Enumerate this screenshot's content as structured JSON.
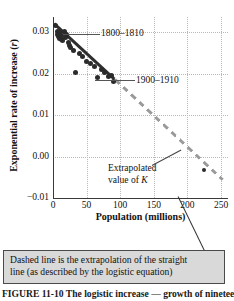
{
  "chart_data": {
    "type": "scatter",
    "title": "",
    "xlabel": "Population (millions)",
    "ylabel": "Exponential rate of increase (r)",
    "xlim": [
      0,
      260
    ],
    "ylim": [
      -0.012,
      0.034
    ],
    "xticks": [
      0,
      50,
      100,
      150,
      200,
      250
    ],
    "xtick_labels": [
      "0",
      "50",
      "100",
      "150",
      "200",
      "250"
    ],
    "yticks": [
      0.03,
      0.02,
      0.01,
      0.0,
      -0.01
    ],
    "ytick_labels": [
      "0.03",
      "0.02",
      "0.01",
      "0.00",
      "−0.01"
    ],
    "grid": true,
    "grid_style": "dotted",
    "legend": "none",
    "series": [
      {
        "name": "Observed decadal growth rates",
        "type": "scatter",
        "marker": "filled-circle",
        "color": "#2b2b2b",
        "x": [
          4,
          6,
          7,
          8,
          9,
          10,
          11,
          12,
          13,
          14,
          17,
          19,
          20,
          23,
          24,
          26,
          31,
          33,
          39,
          44,
          50,
          55,
          62,
          66,
          72,
          76,
          83,
          87,
          90
        ],
        "y": [
          0.0318,
          0.0303,
          0.0295,
          0.029,
          0.0286,
          0.03,
          0.0288,
          0.0284,
          0.0292,
          0.028,
          0.0302,
          0.0288,
          0.0296,
          0.0276,
          0.0268,
          0.0262,
          0.0256,
          0.02,
          0.0248,
          0.024,
          0.0228,
          0.0222,
          0.0214,
          0.0186,
          0.0206,
          0.0198,
          0.019,
          0.0192,
          0.0176
        ]
      },
      {
        "name": "Extrapolated value of K point",
        "type": "scatter",
        "marker": "filled-circle",
        "color": "#2b2b2b",
        "x": [
          225
        ],
        "y": [
          -0.005
        ]
      },
      {
        "name": "Fitted straight line (logistic)",
        "type": "line",
        "style": "solid",
        "color": "#2f2f2f",
        "x": [
          2,
          92
        ],
        "y": [
          0.0322,
          0.018
        ]
      },
      {
        "name": "Extrapolation of straight line",
        "type": "line",
        "style": "dashed",
        "color": "#9a9a9a",
        "x": [
          92,
          252
        ],
        "y": [
          0.018,
          -0.0075
        ]
      }
    ],
    "annotations": [
      {
        "name": "1800-1810",
        "text": "1800–1810",
        "points_to_x": 9,
        "points_to_y": 0.0312
      },
      {
        "name": "1900-1910",
        "text": "1900–1910",
        "points_to_x": 90,
        "points_to_y": 0.0183
      },
      {
        "name": "extrapolated-value-of-k",
        "text_line1": "Extrapolated",
        "text_line2": "value of ",
        "italic": "K",
        "points_to_x": 196,
        "points_to_y": 0.0
      }
    ]
  },
  "chart": {
    "y_axis_title_text": "Exponential rate of increase (",
    "y_axis_title_italic": "r",
    "y_axis_title_close": ")",
    "x_axis_title": "Population (millions)"
  },
  "annotations": {
    "first_decade": "1800–1810",
    "last_decade": "1900–1910",
    "extrapolated_line1": "Extrapolated",
    "extrapolated_line2_pre": "value of ",
    "extrapolated_line2_italic": "K"
  },
  "caption_box": {
    "line1": "Dashed line is the extrapolation of the straight",
    "line2": "line (as described by the logistic equation)",
    "background": "#d9d9d9",
    "border": "#4a4a4a"
  },
  "figure_caption": {
    "text": "FIGURE 11-10  The logistic increase — growth of nineteenth"
  },
  "colors": {
    "point": "#2b2b2b",
    "fit_line": "#2f2f2f",
    "extrapolation_line": "#9a9a9a",
    "grid": "#b9b9b9",
    "axis": "#3a3a3a"
  }
}
